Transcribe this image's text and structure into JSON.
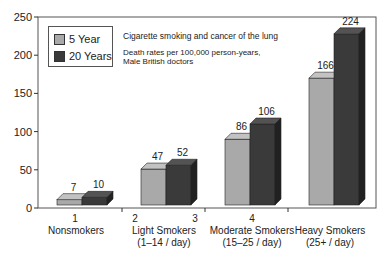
{
  "chart_data": {
    "type": "bar",
    "title": "Cigarette smoking and cancer of the lung",
    "subtitle": "Death rates per 100,000 person-years, Male British doctors",
    "xlabel": "",
    "ylabel": "",
    "ylim": [
      0,
      250
    ],
    "yticks": [
      0,
      50,
      100,
      150,
      200,
      250
    ],
    "x_tick_numbers": [
      "1",
      "2",
      "3",
      "4"
    ],
    "categories": [
      {
        "line1": "Nonsmokers",
        "line2": ""
      },
      {
        "line1": "Light Smokers",
        "line2": "(1–14 / day)"
      },
      {
        "line1": "Moderate Smokers",
        "line2": "(15–25 / day)"
      },
      {
        "line1": "Heavy Smokers",
        "line2": "(25+ / day)"
      }
    ],
    "series": [
      {
        "name": "5 Year",
        "color": "#a9a9a9",
        "values": [
          7,
          47,
          86,
          166
        ]
      },
      {
        "name": "20 Years",
        "color": "#3a3a3a",
        "values": [
          10,
          52,
          106,
          224
        ]
      }
    ],
    "grid": false,
    "legend_position": "upper-left",
    "style": "3d-bar"
  },
  "legend": {
    "items": [
      {
        "label": "5 Year",
        "color": "#a9a9a9"
      },
      {
        "label": "20 Years",
        "color": "#3a3a3a"
      }
    ]
  },
  "annotations": {
    "title": "Cigarette smoking and cancer of the lung",
    "subtitle_line1": "Death rates per 100,000 person-years,",
    "subtitle_line2": "Male British doctors"
  }
}
